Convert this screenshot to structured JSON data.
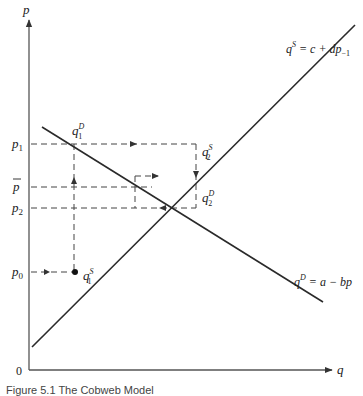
{
  "diagram": {
    "axes": {
      "y_label": "p",
      "x_label": "q",
      "origin_label": "0"
    },
    "price_levels": {
      "p1": {
        "label": "p",
        "sub": "1"
      },
      "pbar": {
        "label": "p"
      },
      "p2": {
        "label": "p",
        "sub": "2"
      },
      "p0": {
        "label": "p",
        "sub": "0"
      }
    },
    "curves": {
      "supply": {
        "eq_lhs": "q",
        "eq_sup": "S",
        "eq_rhs": " = c + dp",
        "eq_sub": "−1"
      },
      "demand": {
        "eq_lhs": "q",
        "eq_sup": "D",
        "eq_rhs": " = a − bp"
      }
    },
    "points": {
      "q1D": {
        "label": "q",
        "sup": "D",
        "sub": "1"
      },
      "q2S": {
        "label": "q",
        "sup": "S",
        "sub": "2"
      },
      "q2D": {
        "label": "q",
        "sup": "D",
        "sub": "2"
      },
      "q1S": {
        "label": "q",
        "sup": "S",
        "sub": "1"
      }
    },
    "caption": "Figure 5.1  The Cobweb Model",
    "line_color": "#2a2a2a",
    "dash_color": "#444444"
  }
}
